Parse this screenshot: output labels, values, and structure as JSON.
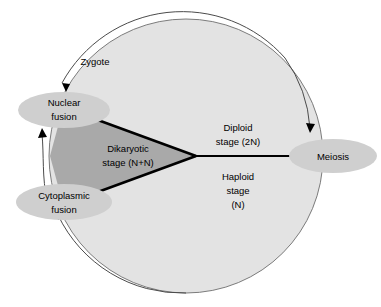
{
  "diagram": {
    "nodes": [
      {
        "id": "nuclear-fusion",
        "label_line1": "Nuclear",
        "label_line2": "fusion"
      },
      {
        "id": "cytoplasmic-fusion",
        "label_line1": "Cytoplasmic",
        "label_line2": "fusion"
      },
      {
        "id": "meiosis",
        "label_line1": "Meiosis",
        "label_line2": ""
      }
    ],
    "stage_labels": {
      "dikaryotic_line1": "Dikaryotic",
      "dikaryotic_line2": "stage (N+N)",
      "diploid_line1": "Diploid",
      "diploid_line2": "stage (2N)",
      "haploid_line1": "Haploid",
      "haploid_line2": "stage",
      "haploid_line3": "(N)"
    },
    "annotations": {
      "zygote": "Zygote"
    },
    "colors": {
      "background": "#ffffff",
      "cycle_fill": "#e3e3e3",
      "cycle_stroke": "#6d6d6d",
      "wedge_fill": "#a9a9a9",
      "node_fill": "#cfcfcf",
      "line": "#000000",
      "arc": "#4b4b4b",
      "text": "#000000"
    }
  }
}
